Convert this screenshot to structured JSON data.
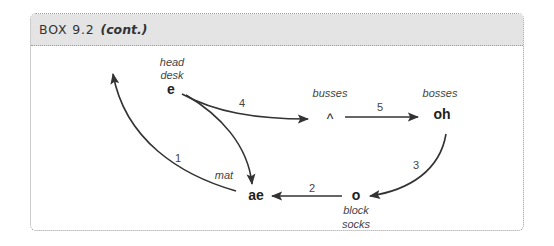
{
  "box": {
    "label": "BOX 9.2",
    "cont": "(cont.)"
  },
  "nodes": {
    "e": {
      "symbol": "e",
      "words": [
        "head",
        "desk"
      ]
    },
    "caret": {
      "symbol": "^",
      "words": [
        "busses"
      ]
    },
    "oh": {
      "symbol": "oh",
      "words": [
        "bosses"
      ]
    },
    "o": {
      "symbol": "o",
      "words": [
        "block",
        "socks"
      ]
    },
    "ae": {
      "symbol": "ae",
      "words": [
        "mat"
      ]
    }
  },
  "edges": [
    {
      "label": "1",
      "from": "ae",
      "to": "upper-left"
    },
    {
      "label": "2",
      "from": "o",
      "to": "ae"
    },
    {
      "label": "3",
      "from": "oh",
      "to": "o"
    },
    {
      "label": "4",
      "from": "e",
      "to": "caret"
    },
    {
      "label": "5",
      "from": "caret",
      "to": "oh"
    },
    {
      "label": "",
      "from": "e",
      "to": "ae"
    }
  ],
  "colors": {
    "header_bg": "#e4e4e4",
    "border": "#9a9a9a",
    "arrow": "#333333"
  }
}
